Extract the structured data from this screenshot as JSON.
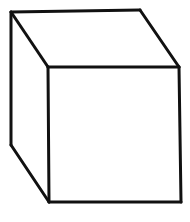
{
  "figure": {
    "background": "#ffffff",
    "stroke_color": "#111111",
    "stroke_width": 3,
    "vertices": {
      "back_top_left": [
        11,
        12
      ],
      "back_top_right": [
        140,
        10
      ],
      "back_bottom_left": [
        11,
        145
      ],
      "front_top_left": [
        48,
        67
      ],
      "front_top_right": [
        179,
        67
      ],
      "front_bottom_left": [
        49,
        202
      ],
      "front_bottom_right": [
        181,
        202
      ]
    },
    "edges": [
      {
        "name": "top-back-edge",
        "from": [
          11,
          12
        ],
        "to": [
          140,
          10
        ]
      },
      {
        "name": "top-left-diagonal-edge",
        "from": [
          11,
          12
        ],
        "to": [
          48,
          67
        ]
      },
      {
        "name": "top-right-diagonal-edge",
        "from": [
          140,
          10
        ],
        "to": [
          179,
          67
        ]
      },
      {
        "name": "front-top-edge",
        "from": [
          48,
          67
        ],
        "to": [
          179,
          67
        ]
      },
      {
        "name": "back-left-vertical-edge",
        "from": [
          11,
          12
        ],
        "to": [
          11,
          145
        ]
      },
      {
        "name": "bottom-left-diagonal-edge",
        "from": [
          11,
          145
        ],
        "to": [
          49,
          202
        ]
      },
      {
        "name": "front-left-vertical-edge",
        "from": [
          48,
          67
        ],
        "to": [
          49,
          202
        ]
      },
      {
        "name": "front-right-vertical-edge",
        "from": [
          179,
          67
        ],
        "to": [
          181,
          202
        ]
      },
      {
        "name": "front-bottom-edge",
        "from": [
          49,
          202
        ],
        "to": [
          181,
          202
        ]
      }
    ]
  }
}
